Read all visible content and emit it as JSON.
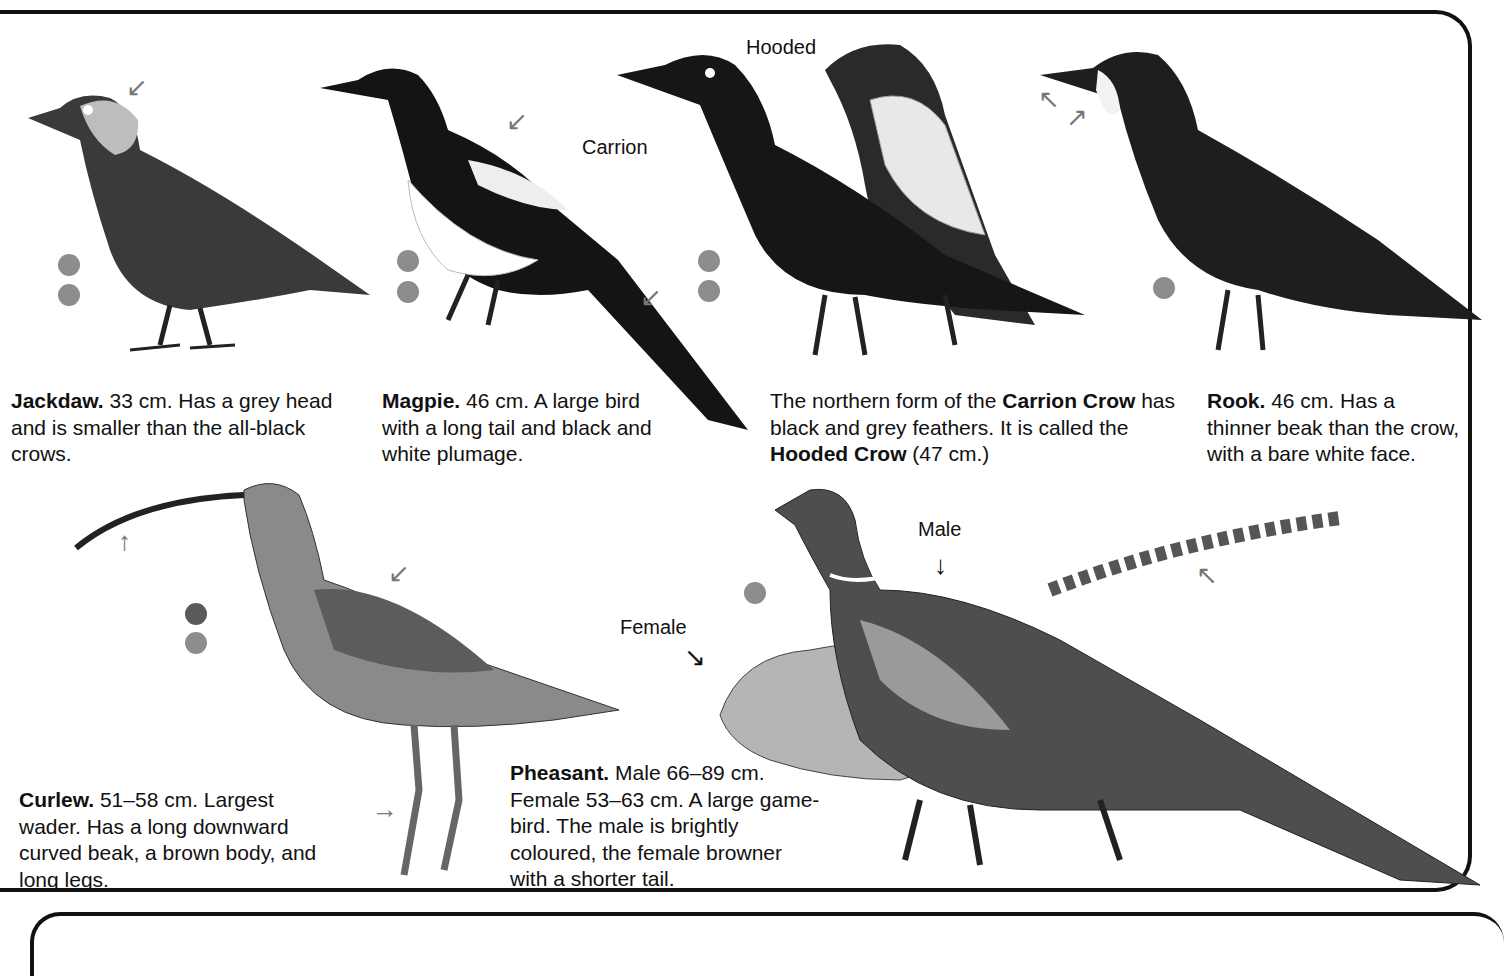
{
  "captions": {
    "jackdaw": {
      "name": "Jackdaw.",
      "text": " 33 cm. Has a grey head and is smaller than the all-black crows."
    },
    "magpie": {
      "name": "Magpie.",
      "text": " 46 cm. A large bird with a long tail and black and white plumage."
    },
    "crow": {
      "pre": "The northern form of the ",
      "name1": "Carrion Crow",
      "mid": " has black and grey feathers. It is called the ",
      "name2": "Hooded Crow",
      "post": " (47 cm.)"
    },
    "rook": {
      "name": "Rook.",
      "text": " 46 cm. Has a thinner beak than the crow, with a bare white face."
    },
    "curlew": {
      "name": "Curlew.",
      "text": " 51–58 cm. Largest wader. Has a long downward curved beak, a brown body, and long legs."
    },
    "pheasant": {
      "name": "Pheasant.",
      "text": " Male 66–89 cm. Female 53–63 cm. A large game-bird. The male is brightly coloured, the female browner with a shorter tail."
    }
  },
  "labels": {
    "hooded": "Hooded",
    "carrion": "Carrion",
    "male": "Male",
    "female": "Female"
  },
  "colors": {
    "dot_light": "#8d8d8d",
    "dot_dark": "#5a5a5a",
    "border": "#111111"
  }
}
